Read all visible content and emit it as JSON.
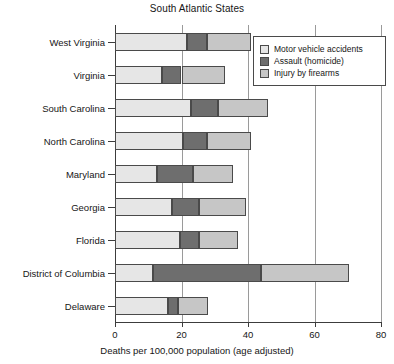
{
  "chart_data": {
    "type": "bar",
    "orientation": "horizontal",
    "stacked": true,
    "title": "South Atlantic States",
    "xlabel": "Deaths per 100,000 population (age adjusted)",
    "ylabel": "",
    "xlim": [
      0,
      80
    ],
    "xticks": [
      0,
      20,
      40,
      60,
      80
    ],
    "xtick_labels": [
      "0",
      "20",
      "40",
      "60",
      "80"
    ],
    "grid": true,
    "grid_axis": "x",
    "legend_position": "top-right",
    "categories": [
      "West Virginia",
      "Virginia",
      "South Carolina",
      "North Carolina",
      "Maryland",
      "Georgia",
      "Florida",
      "District of Columbia",
      "Delaware"
    ],
    "series": [
      {
        "name": "Motor vehicle accidents",
        "color": "#e6e6e6",
        "values": [
          21.8,
          14.0,
          23.0,
          20.6,
          12.6,
          17.0,
          19.5,
          11.5,
          16.0
        ]
      },
      {
        "name": "Assault (homicide)",
        "color": "#6e6e6e",
        "values": [
          5.8,
          6.0,
          8.0,
          7.0,
          11.0,
          8.4,
          5.9,
          32.3,
          3.0
        ]
      },
      {
        "name": "Injury by firearms",
        "color": "#c6c6c6",
        "values": [
          13.4,
          13.0,
          15.0,
          13.3,
          12.0,
          14.0,
          11.6,
          26.5,
          9.0
        ]
      }
    ],
    "totals": [
      41.0,
      33.0,
      46.0,
      40.9,
      35.6,
      39.4,
      37.0,
      70.3,
      28.0
    ]
  },
  "legend": {
    "items": [
      {
        "label": "Motor vehicle accidents",
        "swatch": "#e6e6e6"
      },
      {
        "label": "Assault (homicide)",
        "swatch": "#6e6e6e"
      },
      {
        "label": "Injury by firearms",
        "swatch": "#c6c6c6"
      }
    ]
  },
  "colors": {
    "motor_vehicle_accidents": "#e6e6e6",
    "assault_homicide": "#6e6e6e",
    "injury_by_firearms": "#c6c6c6",
    "axis": "#3c3c3c",
    "grid": "#9a9a9a",
    "background": "#ffffff"
  }
}
